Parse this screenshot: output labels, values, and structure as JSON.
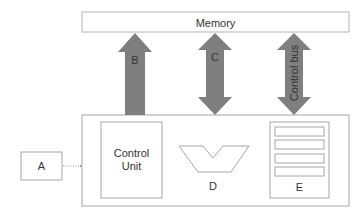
{
  "diagram": {
    "memory": {
      "label": "Memory"
    },
    "arrows": [
      {
        "id": "B",
        "label": "B",
        "direction": "up"
      },
      {
        "id": "C",
        "label": "C",
        "direction": "both"
      },
      {
        "id": "control_bus",
        "label": "Control bus",
        "direction": "both"
      }
    ],
    "cpu": {
      "control_unit": {
        "line1": "Control",
        "line2": "Unit"
      },
      "alu_label": "D",
      "registers_label": "E",
      "register_count": 4
    },
    "input": {
      "label": "A"
    },
    "colors": {
      "arrow_fill": "#7f7f7f",
      "box_stroke": "#a6a6a6",
      "text": "#333333"
    }
  }
}
